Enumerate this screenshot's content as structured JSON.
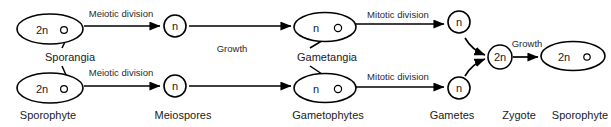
{
  "diagram": {
    "background_color": "#ffffff",
    "stroke_color": "#000000",
    "text_color": "#1a1a1a",
    "stages": [
      {
        "id": "sporophyte-top",
        "ploidy": "2n",
        "shape": "ellipse",
        "cx": 50,
        "cy": 29,
        "rx": 33,
        "ry": 15,
        "text_x": 42,
        "text_y": 30,
        "organ_dot": {
          "cx": 64,
          "cy": 30,
          "r": 3.4
        }
      },
      {
        "id": "sporophyte-bottom",
        "ploidy": "2n",
        "shape": "ellipse",
        "cx": 50,
        "cy": 88,
        "rx": 33,
        "ry": 15,
        "text_x": 42,
        "text_y": 89,
        "organ_dot": {
          "cx": 64,
          "cy": 89,
          "r": 3.4
        }
      },
      {
        "id": "meiospore-top",
        "ploidy": "n",
        "shape": "circle",
        "cx": 175,
        "cy": 26,
        "rx": 11,
        "ry": 11,
        "text_x": 175,
        "text_y": 26,
        "organ_dot": null
      },
      {
        "id": "meiospore-bottom",
        "ploidy": "n",
        "shape": "circle",
        "cx": 175,
        "cy": 86,
        "rx": 11,
        "ry": 11,
        "text_x": 175,
        "text_y": 86,
        "organ_dot": null
      },
      {
        "id": "gametophyte-top",
        "ploidy": "n",
        "shape": "ellipse",
        "cx": 325,
        "cy": 27,
        "rx": 31,
        "ry": 14.5,
        "text_x": 316,
        "text_y": 28,
        "organ_dot": {
          "cx": 338,
          "cy": 28,
          "r": 3.6
        }
      },
      {
        "id": "gametophyte-bottom",
        "ploidy": "n",
        "shape": "ellipse",
        "cx": 325,
        "cy": 88,
        "rx": 31,
        "ry": 14.5,
        "text_x": 316,
        "text_y": 89,
        "organ_dot": {
          "cx": 338,
          "cy": 89,
          "r": 3.6
        }
      },
      {
        "id": "gamete-top",
        "ploidy": "n",
        "shape": "circle",
        "cx": 459,
        "cy": 22,
        "rx": 11,
        "ry": 11,
        "text_x": 459,
        "text_y": 22,
        "organ_dot": null
      },
      {
        "id": "gamete-bottom",
        "ploidy": "n",
        "shape": "circle",
        "cx": 459,
        "cy": 88,
        "rx": 11,
        "ry": 11,
        "text_x": 459,
        "text_y": 88,
        "organ_dot": null
      },
      {
        "id": "zygote",
        "ploidy": "2n",
        "shape": "circle",
        "cx": 500,
        "cy": 57,
        "rx": 12,
        "ry": 12,
        "text_x": 500,
        "text_y": 57,
        "organ_dot": null
      },
      {
        "id": "sporophyte-final",
        "ploidy": "2n",
        "shape": "ellipse",
        "cx": 573,
        "cy": 56,
        "rx": 32,
        "ry": 14.5,
        "text_x": 564,
        "text_y": 57,
        "organ_dot": {
          "cx": 587,
          "cy": 57,
          "r": 3.2
        }
      }
    ],
    "arrows": [
      {
        "id": "meiosis-top",
        "label": "Meiotic division",
        "label_x": 121,
        "label_y": 13,
        "path": "M 84 26 L 160 26",
        "curved": false
      },
      {
        "id": "meiosis-bottom",
        "label": "Meiotic division",
        "label_x": 121,
        "label_y": 72,
        "path": "M 84 86 L 160 86",
        "curved": false
      },
      {
        "id": "growth-top",
        "label": "Growth",
        "label_x": 232,
        "label_y": 48,
        "path": "M 189 26 L 291 26",
        "curved": false
      },
      {
        "id": "growth-bottom",
        "label": "",
        "label_x": 232,
        "label_y": 72,
        "path": "M 189 86 L 291 86",
        "curved": false
      },
      {
        "id": "mitosis-top",
        "label": "Mitotic division",
        "label_x": 398,
        "label_y": 14,
        "path": "M 356 24 L 444 24",
        "curved": false
      },
      {
        "id": "mitosis-bottom",
        "label": "Mitotic division",
        "label_x": 398,
        "label_y": 76,
        "path": "M 356 87 L 444 87",
        "curved": false
      },
      {
        "id": "fertilization-top",
        "label": "",
        "label_x": 0,
        "label_y": 0,
        "path": "M 465 38 Q 472 50 485 55",
        "curved": true
      },
      {
        "id": "fertilization-bottom",
        "label": "",
        "label_x": 0,
        "label_y": 0,
        "path": "M 465 76 Q 472 64 485 59",
        "curved": true
      },
      {
        "id": "zygote-growth",
        "label": "Growth",
        "label_x": 527,
        "label_y": 43,
        "path": "M 513 57 L 538 57",
        "curved": false
      }
    ],
    "organ_labels": [
      {
        "id": "sporangia",
        "text": "Sporangia",
        "x": 70,
        "y": 57,
        "leaders": [
          "M 62 48 L 70 32",
          "M 62 66 L 70 84"
        ]
      },
      {
        "id": "gametangia",
        "text": "Gametangia",
        "x": 327,
        "y": 57,
        "leaders": [
          "M 310 48 L 340 30",
          "M 310 66 L 340 86"
        ]
      }
    ],
    "stage_labels": [
      {
        "id": "label-sporophyte",
        "text": "Sporophyte",
        "x": 48,
        "y": 115
      },
      {
        "id": "label-meiospores",
        "text": "Meiospores",
        "x": 183,
        "y": 115
      },
      {
        "id": "label-gametophytes",
        "text": "Gametophytes",
        "x": 328,
        "y": 115
      },
      {
        "id": "label-gametes",
        "text": "Gametes",
        "x": 452,
        "y": 115
      },
      {
        "id": "label-zygote",
        "text": "Zygote",
        "x": 519,
        "y": 115
      },
      {
        "id": "label-sporophyte-final",
        "text": "Sporophyte",
        "x": 580,
        "y": 115
      }
    ]
  }
}
